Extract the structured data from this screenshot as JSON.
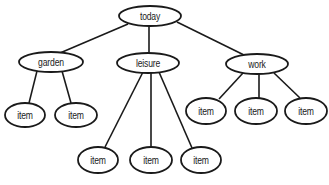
{
  "diagram": {
    "type": "tree",
    "root": {
      "label": "today",
      "cx": 150,
      "cy": 16,
      "rx": 31,
      "ry": 10,
      "children": [
        {
          "label": "garden",
          "cx": 51,
          "cy": 62,
          "rx": 32,
          "ry": 10,
          "children": [
            {
              "label": "item",
              "cx": 25,
              "cy": 115,
              "rx": 20,
              "ry": 12
            },
            {
              "label": "item",
              "cx": 76,
              "cy": 115,
              "rx": 21,
              "ry": 12
            }
          ]
        },
        {
          "label": "leisure",
          "cx": 148,
          "cy": 63,
          "rx": 31,
          "ry": 10,
          "children": [
            {
              "label": "item",
              "cx": 98,
              "cy": 160,
              "rx": 20,
              "ry": 13
            },
            {
              "label": "item",
              "cx": 151,
              "cy": 160,
              "rx": 21,
              "ry": 13
            },
            {
              "label": "item",
              "cx": 201,
              "cy": 160,
              "rx": 20,
              "ry": 13
            }
          ]
        },
        {
          "label": "work",
          "cx": 257,
          "cy": 64,
          "rx": 31,
          "ry": 10,
          "children": [
            {
              "label": "item",
              "cx": 206,
              "cy": 111,
              "rx": 20,
              "ry": 13
            },
            {
              "label": "item",
              "cx": 256,
              "cy": 111,
              "rx": 21,
              "ry": 13
            },
            {
              "label": "item",
              "cx": 306,
              "cy": 111,
              "rx": 21,
              "ry": 13
            }
          ]
        }
      ]
    },
    "edges": [
      {
        "from": "today",
        "to": "garden",
        "x1": 128,
        "y1": 24,
        "x2": 60,
        "y2": 53
      },
      {
        "from": "today",
        "to": "leisure",
        "x1": 149,
        "y1": 26,
        "x2": 149,
        "y2": 53
      },
      {
        "from": "today",
        "to": "work",
        "x1": 177,
        "y1": 22,
        "x2": 244,
        "y2": 55
      },
      {
        "from": "garden",
        "to": "item",
        "x1": 37,
        "y1": 71,
        "x2": 29,
        "y2": 103
      },
      {
        "from": "garden",
        "to": "item",
        "x1": 62,
        "y1": 71,
        "x2": 71,
        "y2": 103
      },
      {
        "from": "leisure",
        "to": "item",
        "x1": 143,
        "y1": 72,
        "x2": 105,
        "y2": 147
      },
      {
        "from": "leisure",
        "to": "item",
        "x1": 151,
        "y1": 73,
        "x2": 151,
        "y2": 147
      },
      {
        "from": "leisure",
        "to": "item",
        "x1": 159,
        "y1": 72,
        "x2": 192,
        "y2": 148
      },
      {
        "from": "work",
        "to": "item",
        "x1": 243,
        "y1": 73,
        "x2": 219,
        "y2": 99
      },
      {
        "from": "work",
        "to": "item",
        "x1": 259,
        "y1": 74,
        "x2": 259,
        "y2": 98
      },
      {
        "from": "work",
        "to": "item",
        "x1": 274,
        "y1": 73,
        "x2": 300,
        "y2": 98
      }
    ]
  }
}
